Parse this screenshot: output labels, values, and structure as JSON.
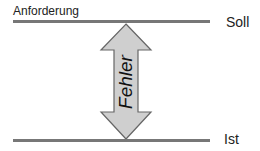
{
  "diagram": {
    "top_label": "Anforderung",
    "top_level": "Soll",
    "bottom_level": "Ist",
    "arrow_label": "Fehler"
  },
  "colors": {
    "line": "#777777",
    "arrow_fill": "#cfcfcf",
    "arrow_stroke": "#666666"
  }
}
